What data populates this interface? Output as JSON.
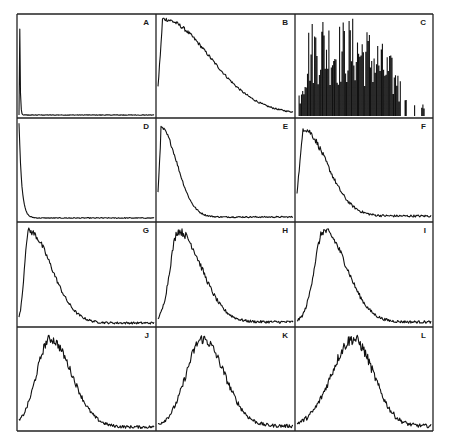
{
  "figure": {
    "layout": {
      "rows": 4,
      "cols": 3
    },
    "frame_color": "#222222",
    "trace_color": "#111111",
    "background": "#ffffff"
  },
  "chart_data": [
    {
      "panel": "A",
      "type": "line",
      "shape": "spike-decay",
      "peak_x": 0.005,
      "peak_y": 1.0,
      "decay": 0.004,
      "baseline": 0.01,
      "noise": 0.01,
      "x": [
        0,
        0.01,
        0.05,
        0.2,
        0.5,
        1.0
      ],
      "y": [
        1.0,
        0.03,
        0.01,
        0.01,
        0.01,
        0.01
      ]
    },
    {
      "panel": "B",
      "type": "line",
      "shape": "decay",
      "peak_x": 0.03,
      "peak_y": 0.97,
      "decay": 0.35,
      "baseline": 0.02,
      "noise": 0.03,
      "x": [
        0,
        0.05,
        0.2,
        0.4,
        0.6,
        0.8,
        1.0
      ],
      "y": [
        0.95,
        0.95,
        0.75,
        0.42,
        0.15,
        0.05,
        0.03
      ]
    },
    {
      "panel": "C",
      "type": "bar",
      "shape": "spiky",
      "x_start": 0.03,
      "x_end": 0.97,
      "noise": 0.45,
      "x": [
        0.03,
        0.1,
        0.2,
        0.3,
        0.4,
        0.5,
        0.6,
        0.7,
        0.8,
        0.9,
        0.97
      ],
      "y": [
        0.2,
        0.7,
        0.8,
        0.7,
        0.75,
        0.7,
        0.6,
        0.45,
        0.2,
        0.15,
        0.15
      ]
    },
    {
      "panel": "D",
      "type": "line",
      "shape": "spike-decay",
      "peak_x": 0.0,
      "peak_y": 0.98,
      "decay": 0.02,
      "baseline": 0.02,
      "noise": 0.02,
      "x": [
        0,
        0.01,
        0.03,
        0.08,
        0.2,
        1.0
      ],
      "y": [
        0.98,
        0.5,
        0.1,
        0.04,
        0.02,
        0.02
      ]
    },
    {
      "panel": "E",
      "type": "line",
      "shape": "decay",
      "peak_x": 0.02,
      "peak_y": 0.92,
      "decay": 0.12,
      "baseline": 0.03,
      "noise": 0.03,
      "x": [
        0,
        0.02,
        0.1,
        0.2,
        0.3,
        0.5,
        1.0
      ],
      "y": [
        0.5,
        0.92,
        0.5,
        0.2,
        0.08,
        0.04,
        0.03
      ]
    },
    {
      "panel": "F",
      "type": "line",
      "shape": "decay",
      "peak_x": 0.04,
      "peak_y": 0.92,
      "decay": 0.18,
      "baseline": 0.04,
      "noise": 0.05,
      "x": [
        0,
        0.04,
        0.15,
        0.3,
        0.45,
        0.6,
        1.0
      ],
      "y": [
        0.3,
        0.92,
        0.7,
        0.35,
        0.12,
        0.05,
        0.04
      ]
    },
    {
      "panel": "G",
      "type": "line",
      "shape": "skewed-peak",
      "peak_x": 0.07,
      "peak_y": 0.93,
      "rise": 0.03,
      "decay": 0.17,
      "baseline": 0.02,
      "noise": 0.05,
      "x": [
        0,
        0.03,
        0.07,
        0.2,
        0.35,
        0.5,
        1.0
      ],
      "y": [
        0.0,
        0.6,
        0.93,
        0.55,
        0.15,
        0.04,
        0.02
      ]
    },
    {
      "panel": "H",
      "type": "line",
      "shape": "skewed-peak",
      "peak_x": 0.15,
      "peak_y": 0.93,
      "rise": 0.06,
      "decay": 0.17,
      "baseline": 0.03,
      "noise": 0.06,
      "x": [
        0,
        0.05,
        0.15,
        0.3,
        0.45,
        0.6,
        1.0
      ],
      "y": [
        0.0,
        0.3,
        0.93,
        0.5,
        0.15,
        0.05,
        0.03
      ]
    },
    {
      "panel": "I",
      "type": "line",
      "shape": "skewed-peak",
      "peak_x": 0.2,
      "peak_y": 0.93,
      "rise": 0.07,
      "decay": 0.17,
      "baseline": 0.03,
      "noise": 0.06,
      "x": [
        0,
        0.08,
        0.2,
        0.35,
        0.5,
        0.7,
        1.0
      ],
      "y": [
        0.0,
        0.2,
        0.93,
        0.55,
        0.18,
        0.05,
        0.03
      ]
    },
    {
      "panel": "J",
      "type": "line",
      "shape": "skewed-peak",
      "peak_x": 0.23,
      "peak_y": 0.9,
      "rise": 0.1,
      "decay": 0.16,
      "baseline": 0.02,
      "noise": 0.07,
      "x": [
        0,
        0.1,
        0.23,
        0.35,
        0.5,
        0.7,
        1.0
      ],
      "y": [
        0.02,
        0.25,
        0.9,
        0.6,
        0.2,
        0.04,
        0.02
      ]
    },
    {
      "panel": "K",
      "type": "line",
      "shape": "skewed-peak",
      "peak_x": 0.33,
      "peak_y": 0.9,
      "rise": 0.12,
      "decay": 0.16,
      "baseline": 0.03,
      "noise": 0.08,
      "x": [
        0,
        0.1,
        0.2,
        0.33,
        0.5,
        0.7,
        1.0
      ],
      "y": [
        0.0,
        0.15,
        0.3,
        0.9,
        0.4,
        0.08,
        0.03
      ]
    },
    {
      "panel": "L",
      "type": "line",
      "shape": "skewed-peak",
      "peak_x": 0.42,
      "peak_y": 0.9,
      "rise": 0.16,
      "decay": 0.15,
      "baseline": 0.03,
      "noise": 0.09,
      "x": [
        0,
        0.1,
        0.25,
        0.42,
        0.6,
        0.8,
        1.0
      ],
      "y": [
        0.0,
        0.15,
        0.35,
        0.9,
        0.4,
        0.08,
        0.03
      ]
    }
  ],
  "panels_geometry": {
    "col_edges": [
      17,
      156,
      295,
      433
    ],
    "row_edges": [
      14,
      118,
      222,
      327,
      431
    ]
  }
}
